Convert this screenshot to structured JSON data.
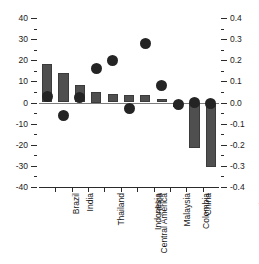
{
  "chart_data": {
    "type": "bar",
    "title": "",
    "subtitle": "",
    "xlabel": "",
    "ylabel": "",
    "y2label": "",
    "categories": [
      "Brazil",
      "India",
      "Thailand",
      "Central America",
      "Indonesia",
      "Africa",
      "Malaysia",
      "Colombia",
      "China",
      "European Union",
      "United States"
    ],
    "series": [
      {
        "name": "bars",
        "axis": "left",
        "marker": "bar",
        "color": "#4f4f4f",
        "values": [
          18,
          14,
          8.5,
          5,
          4,
          3.5,
          3.5,
          1.5,
          -2,
          -21.5,
          -30.5
        ]
      },
      {
        "name": "dots",
        "axis": "right",
        "marker": "circle",
        "color": "#242424",
        "values": [
          0.03,
          -0.06,
          0.025,
          0.16,
          0.2,
          -0.03,
          0.28,
          0.08,
          -0.01,
          0.0,
          -0.005
        ]
      }
    ],
    "ylim": [
      -40,
      40
    ],
    "y2lim": [
      -0.4,
      0.4
    ],
    "yticks": [
      40,
      30,
      20,
      10,
      0,
      -10,
      -20,
      -30,
      -40
    ],
    "ytick_labels": [
      "40",
      "30",
      "20",
      "10",
      "0",
      "-10",
      "-20",
      "-30",
      "-40"
    ],
    "y2ticks": [
      0.4,
      0.3,
      0.2,
      0.1,
      0.0,
      -0.1,
      -0.2,
      -0.3,
      -0.4
    ],
    "y2tick_labels": [
      "0.4",
      "0.3",
      "0.2",
      "0.1",
      "0.0",
      "-0.1",
      "-0.2",
      "-0.3",
      "-0.4"
    ],
    "yminor_step": 5,
    "grid": false,
    "legend": "none",
    "zero_line": true
  }
}
